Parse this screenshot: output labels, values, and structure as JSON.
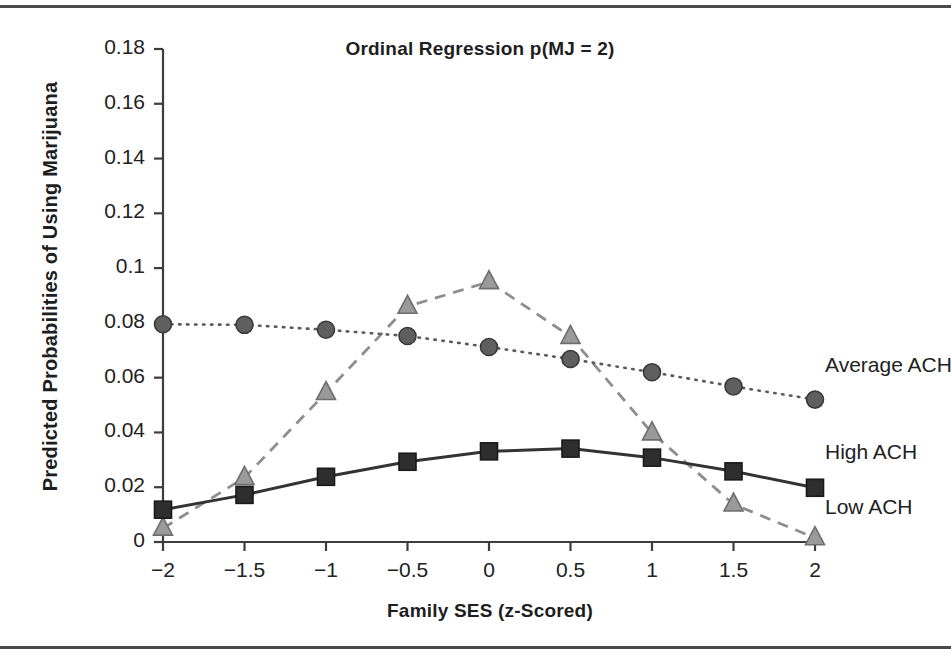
{
  "figure": {
    "title": "Ordinal Regression p(MJ = 2)",
    "xlabel": "Family SES (z-Scored)",
    "ylabel": "Predicted Probabilities of Using Marijuana"
  },
  "series_labels": {
    "average": "Average ACH",
    "high": "High ACH",
    "low": "Low ACH"
  },
  "axis": {
    "x_ticks": [
      "−2",
      "−1.5",
      "−1",
      "−0.5",
      "0",
      "0.5",
      "1",
      "1.5",
      "2"
    ],
    "y_ticks": [
      "0.18",
      "0.16",
      "0.14",
      "0.12",
      "0.1",
      "0.08",
      "0.06",
      "0.04",
      "0.02",
      "0"
    ]
  },
  "colors": {
    "axis": "#3d3d3d",
    "average_series": "#5a5a5a",
    "high_series": "#333333",
    "low_series": "#8e8e8e",
    "text": "#1e1e1e"
  },
  "chart_data": {
    "type": "line",
    "title": "Ordinal Regression p(MJ = 2)",
    "xlabel": "Family SES (z-Scored)",
    "ylabel": "Predicted Probabilities of Using Marijuana",
    "x": [
      -2,
      -1.5,
      -1,
      -0.5,
      0,
      0.5,
      1,
      1.5,
      2
    ],
    "xlim": [
      -2,
      2
    ],
    "ylim": [
      0,
      0.18
    ],
    "grid": false,
    "legend_position": "right-inline",
    "series": [
      {
        "name": "Average ACH",
        "marker": "circle",
        "linestyle": "dotted",
        "values": [
          0.0795,
          0.0793,
          0.0775,
          0.0752,
          0.0712,
          0.0668,
          0.062,
          0.0568,
          0.052
        ]
      },
      {
        "name": "High ACH",
        "marker": "square",
        "linestyle": "solid",
        "values": [
          0.0118,
          0.0172,
          0.0238,
          0.0293,
          0.0331,
          0.0341,
          0.0308,
          0.0258,
          0.0198
        ]
      },
      {
        "name": "Low ACH",
        "marker": "triangle",
        "linestyle": "dashed",
        "values": [
          0.005,
          0.0235,
          0.0545,
          0.086,
          0.095,
          0.075,
          0.0398,
          0.0138,
          0.0015
        ]
      }
    ]
  }
}
